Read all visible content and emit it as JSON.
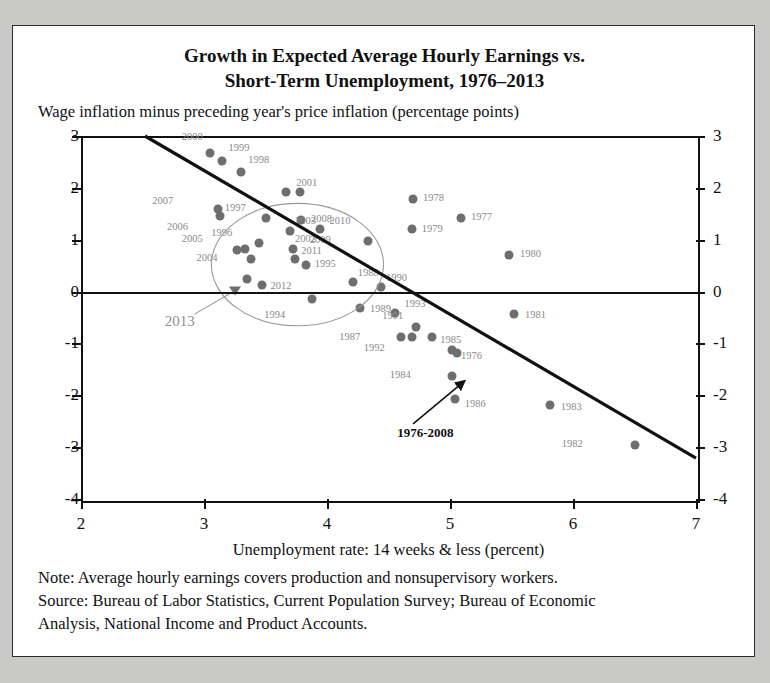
{
  "chart_data": {
    "type": "scatter",
    "title": "Growth in Expected Average Hourly Earnings vs.\nShort-Term Unemployment, 1976–2013",
    "title_line1": "Growth in Expected Average Hourly Earnings vs.",
    "title_line2": "Short-Term Unemployment, 1976–2013",
    "subtitle": "Wage inflation minus preceding year's price inflation (percentage points)",
    "xlabel": "Unemployment rate: 14 weeks & less (percent)",
    "ylabel": "",
    "xlim": [
      2,
      7
    ],
    "ylim": [
      -4,
      3
    ],
    "xticks": [
      "2",
      "3",
      "4",
      "5",
      "6",
      "7"
    ],
    "xtick_values": [
      2,
      3,
      4,
      5,
      6,
      7
    ],
    "yticks": [
      "3",
      "2",
      "1",
      "0",
      "-1",
      "-2",
      "-3",
      "-4"
    ],
    "ytick_values": [
      3,
      2,
      1,
      0,
      -1,
      -2,
      -3,
      -4
    ],
    "grid": false,
    "legend": "none",
    "point_color": "#6e6e6e",
    "line_color": "#111111",
    "label_color": "#8a8a8a",
    "points": [
      {
        "label": "2000",
        "x": 3.05,
        "y": 2.68,
        "lx": -0.06,
        "ly": 0.3
      },
      {
        "label": "1999",
        "x": 3.15,
        "y": 2.52,
        "lx": 0.05,
        "ly": 0.24
      },
      {
        "label": "1998",
        "x": 3.3,
        "y": 2.31,
        "lx": 0.06,
        "ly": 0.22
      },
      {
        "label": "2001",
        "x": 3.67,
        "y": 1.92,
        "lx": 0.08,
        "ly": 0.17
      },
      {
        "label": "2001b",
        "x": 3.78,
        "y": 1.92,
        "lx": 0.0,
        "ly": 0.0,
        "hide_label": true
      },
      {
        "label": "2007",
        "x": 3.11,
        "y": 1.59,
        "lx": -0.36,
        "ly": 0.15
      },
      {
        "label": "2006",
        "x": 3.13,
        "y": 1.45,
        "lx": -0.26,
        "ly": -0.21
      },
      {
        "label": "1997",
        "x": 3.5,
        "y": 1.42,
        "lx": -0.16,
        "ly": 0.2
      },
      {
        "label": "2008",
        "x": 3.79,
        "y": 1.38,
        "lx": 0.08,
        "ly": 0.02
      },
      {
        "label": "2003",
        "x": 3.7,
        "y": 1.16,
        "lx": 0.04,
        "ly": 0.21
      },
      {
        "label": "2010",
        "x": 3.94,
        "y": 1.2,
        "lx": 0.08,
        "ly": 0.17
      },
      {
        "label": "1996",
        "x": 3.45,
        "y": 0.93,
        "lx": -0.22,
        "ly": 0.2
      },
      {
        "label": "2005",
        "x": 3.27,
        "y": 0.81,
        "lx": -0.28,
        "ly": 0.2
      },
      {
        "label": "2002",
        "x": 3.72,
        "y": 0.82,
        "lx": 0.02,
        "ly": 0.2
      },
      {
        "label": "2002b",
        "x": 3.33,
        "y": 0.82,
        "lx": 0.04,
        "ly": 0.16,
        "hide_label": true
      },
      {
        "label": "2011",
        "x": 3.74,
        "y": 0.62,
        "lx": 0.05,
        "ly": 0.17
      },
      {
        "label": "2004",
        "x": 3.38,
        "y": 0.63,
        "lx": -0.27,
        "ly": 0.02
      },
      {
        "label": "2009",
        "x": 4.33,
        "y": 0.98,
        "lx": -0.3,
        "ly": 0.02
      },
      {
        "label": "1995",
        "x": 3.83,
        "y": 0.52,
        "lx": 0.07,
        "ly": 0.02
      },
      {
        "label": "1988",
        "x": 4.21,
        "y": 0.18,
        "lx": 0.04,
        "ly": 0.18
      },
      {
        "label": "1990",
        "x": 4.44,
        "y": 0.08,
        "lx": 0.04,
        "ly": 0.19
      },
      {
        "label": "2012",
        "x": 3.47,
        "y": 0.13,
        "lx": 0.07,
        "ly": -0.02
      },
      {
        "label": "2012b",
        "x": 3.35,
        "y": 0.24,
        "lx": 0.0,
        "ly": 0.0,
        "hide_label": true
      },
      {
        "label": "1994",
        "x": 3.88,
        "y": -0.14,
        "lx": -0.22,
        "ly": -0.32
      },
      {
        "label": "1989",
        "x": 4.27,
        "y": -0.32,
        "lx": 0.08,
        "ly": -0.02
      },
      {
        "label": "1993",
        "x": 4.55,
        "y": -0.42,
        "lx": 0.08,
        "ly": 0.18
      },
      {
        "label": "1978",
        "x": 4.7,
        "y": 1.78,
        "lx": 0.08,
        "ly": 0.02
      },
      {
        "label": "1977",
        "x": 5.09,
        "y": 1.41,
        "lx": 0.08,
        "ly": 0.02
      },
      {
        "label": "1979",
        "x": 4.69,
        "y": 1.21,
        "lx": 0.08,
        "ly": 0.0
      },
      {
        "label": "1980",
        "x": 5.48,
        "y": 0.7,
        "lx": 0.09,
        "ly": 0.02
      },
      {
        "label": "1981",
        "x": 5.52,
        "y": -0.44,
        "lx": 0.09,
        "ly": -0.02
      },
      {
        "label": "1991",
        "x": 4.72,
        "y": -0.69,
        "lx": -0.1,
        "ly": 0.22
      },
      {
        "label": "1987",
        "x": 4.6,
        "y": -0.87,
        "lx": -0.33,
        "ly": 0.0
      },
      {
        "label": "1992",
        "x": 4.69,
        "y": -0.87,
        "lx": -0.22,
        "ly": -0.21
      },
      {
        "label": "1985",
        "x": 4.85,
        "y": -0.88,
        "lx": 0.07,
        "ly": -0.06
      },
      {
        "label": "1976",
        "x": 5.02,
        "y": -1.13,
        "lx": 0.07,
        "ly": -0.12
      },
      {
        "label": "1976b",
        "x": 5.06,
        "y": -1.19,
        "lx": 0.0,
        "ly": 0.0,
        "hide_label": true
      },
      {
        "label": "1984",
        "x": 5.02,
        "y": -1.62,
        "lx": -0.34,
        "ly": 0.02
      },
      {
        "label": "1986",
        "x": 5.04,
        "y": -2.07,
        "lx": 0.08,
        "ly": -0.09
      },
      {
        "label": "1983",
        "x": 5.81,
        "y": -2.18,
        "lx": 0.09,
        "ly": -0.05
      },
      {
        "label": "1982",
        "x": 6.5,
        "y": -2.96,
        "lx": -0.42,
        "ly": 0.02
      }
    ],
    "special_marker": {
      "label": "2013",
      "x": 3.25,
      "y": 0.02,
      "shape": "triangle"
    },
    "marker_2013_label": {
      "text": "2013",
      "x": 2.68,
      "y": -0.58
    },
    "leader_line_2013": {
      "x1": 2.92,
      "y1": -0.44,
      "x2": 3.24,
      "y2": 0.0
    },
    "trend_line": {
      "x1": 2.52,
      "y1": 3.0,
      "x2": 7.0,
      "y2": -3.21
    },
    "trend_annotation": {
      "text": "1976-2008",
      "x": 4.8,
      "y": -2.72
    },
    "trend_arrow": {
      "x1": 4.7,
      "y1": -2.55,
      "x2": 5.12,
      "y2": -1.72
    },
    "ellipse": {
      "cx": 3.76,
      "cy": 0.52,
      "rx": 0.7,
      "ry": 1.18,
      "rotation": 0
    }
  },
  "notes": {
    "line1": "Note: Average hourly earnings covers production and nonsupervisory workers.",
    "line2": "Source: Bureau of Labor Statistics, Current Population Survey; Bureau of Economic",
    "line3": "Analysis, National Income and Product Accounts."
  }
}
